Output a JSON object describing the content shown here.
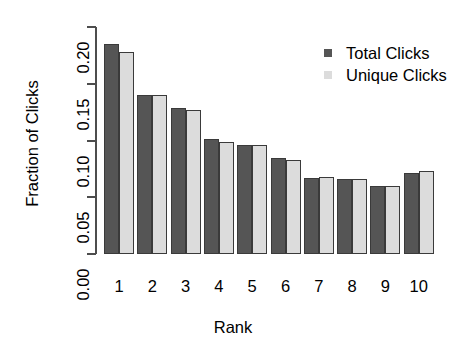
{
  "chart_data": {
    "type": "bar",
    "title": "",
    "xlabel": "Rank",
    "ylabel": "Fraction of Clicks",
    "categories": [
      "1",
      "2",
      "3",
      "4",
      "5",
      "6",
      "7",
      "8",
      "9",
      "10"
    ],
    "series": [
      {
        "name": "Total Clicks",
        "color": "#555555",
        "values": [
          0.185,
          0.14,
          0.129,
          0.101,
          0.096,
          0.085,
          0.067,
          0.066,
          0.06,
          0.071
        ]
      },
      {
        "name": "Unique Clicks",
        "color": "#dcdcdc",
        "values": [
          0.178,
          0.14,
          0.127,
          0.099,
          0.096,
          0.083,
          0.068,
          0.066,
          0.06,
          0.073
        ]
      }
    ],
    "ylim": [
      0.0,
      0.2
    ],
    "yticks": [
      "0.00",
      "0.05",
      "0.10",
      "0.15",
      "0.20"
    ],
    "ytick_values": [
      0.0,
      0.05,
      0.1,
      0.15,
      0.2
    ],
    "grid": false,
    "legend_position": "top-right"
  },
  "legend": {
    "entries": [
      {
        "label": "Total Clicks",
        "swatch": "total"
      },
      {
        "label": "Unique Clicks",
        "swatch": "unique"
      }
    ]
  }
}
